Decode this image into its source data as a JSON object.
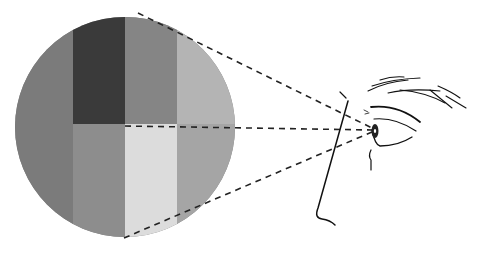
{
  "diagram": {
    "circle": {
      "cx": 125,
      "cy": 127,
      "r": 110,
      "background": "#7a7a7a"
    },
    "tiles": [
      {
        "name": "tile-far-left",
        "x": 15,
        "y": 10,
        "w": 58,
        "h": 235,
        "color": "#7b7b7b"
      },
      {
        "name": "tile-top-dark",
        "x": 73,
        "y": 10,
        "w": 52,
        "h": 114,
        "color": "#3a3a3a"
      },
      {
        "name": "tile-top-mid",
        "x": 125,
        "y": 10,
        "w": 52,
        "h": 114,
        "color": "#858585"
      },
      {
        "name": "tile-top-right",
        "x": 177,
        "y": 10,
        "w": 60,
        "h": 114,
        "color": "#b4b4b4"
      },
      {
        "name": "tile-bottom-left",
        "x": 73,
        "y": 124,
        "w": 52,
        "h": 120,
        "color": "#8d8d8d"
      },
      {
        "name": "tile-bottom-light",
        "x": 125,
        "y": 124,
        "w": 52,
        "h": 120,
        "color": "#dcdcdc"
      },
      {
        "name": "tile-bottom-right",
        "x": 177,
        "y": 124,
        "w": 60,
        "h": 120,
        "color": "#a5a5a5"
      }
    ],
    "sight_lines": {
      "color": "#222222",
      "target": {
        "x": 372,
        "y": 130
      },
      "sources": [
        {
          "x": 138,
          "y": 13
        },
        {
          "x": 125,
          "y": 126
        },
        {
          "x": 124,
          "y": 238
        }
      ]
    },
    "line_color": "#111111"
  }
}
